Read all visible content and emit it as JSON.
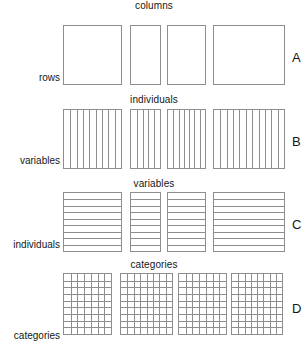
{
  "figure": {
    "title": "",
    "width": 308,
    "height": 357,
    "background": "#ffffff",
    "line_color": "#8e8e8e",
    "text_color": "#161616"
  },
  "rows": [
    {
      "letter": "A",
      "top_label": "columns",
      "left_label": "rows",
      "pattern": "empty",
      "cols": 0,
      "rows": 0,
      "panels": [
        {
          "x": 63,
          "y": 25,
          "w": 59,
          "h": 60
        },
        {
          "x": 130,
          "y": 25,
          "w": 31,
          "h": 60
        },
        {
          "x": 167,
          "y": 25,
          "w": 39,
          "h": 60
        },
        {
          "x": 213,
          "y": 25,
          "w": 72,
          "h": 60
        }
      ]
    },
    {
      "letter": "B",
      "top_label": "individuals",
      "left_label": "variables",
      "pattern": "vertical",
      "cols": 9,
      "rows": 0,
      "panels": [
        {
          "x": 63,
          "y": 109,
          "w": 59,
          "h": 60
        },
        {
          "x": 130,
          "y": 109,
          "w": 31,
          "h": 60
        },
        {
          "x": 167,
          "y": 109,
          "w": 39,
          "h": 60
        },
        {
          "x": 213,
          "y": 109,
          "w": 72,
          "h": 60
        }
      ]
    },
    {
      "letter": "C",
      "top_label": "variables",
      "left_label": "individuals",
      "pattern": "horizontal",
      "cols": 0,
      "rows": 9,
      "panels": [
        {
          "x": 63,
          "y": 192,
          "w": 59,
          "h": 60
        },
        {
          "x": 130,
          "y": 192,
          "w": 31,
          "h": 60
        },
        {
          "x": 167,
          "y": 192,
          "w": 39,
          "h": 60
        },
        {
          "x": 213,
          "y": 192,
          "w": 72,
          "h": 60
        }
      ]
    },
    {
      "letter": "D",
      "top_label": "categories",
      "left_label": "categories",
      "pattern": "grid",
      "cols": 7,
      "rows": 9,
      "panels": [
        {
          "x": 63,
          "y": 273,
          "w": 49,
          "h": 62
        },
        {
          "x": 120,
          "y": 273,
          "w": 53,
          "h": 62
        },
        {
          "x": 178,
          "y": 273,
          "w": 49,
          "h": 62
        },
        {
          "x": 231,
          "y": 273,
          "w": 52,
          "h": 62
        }
      ]
    }
  ]
}
